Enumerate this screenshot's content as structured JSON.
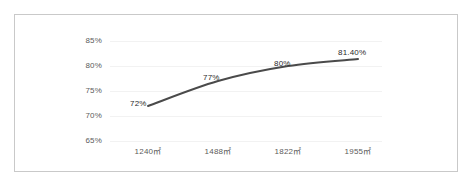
{
  "chart_data": {
    "type": "line",
    "title": "",
    "subtitle": "",
    "xlabel": "",
    "ylabel": "",
    "categories": [
      "1240㎡",
      "1488㎡",
      "1822㎡",
      "1955㎡"
    ],
    "values": [
      72,
      77,
      80,
      81.4
    ],
    "point_labels": [
      "72%",
      "77%",
      "80%",
      "81.40%"
    ],
    "yticks": [
      "85%",
      "80%",
      "75%",
      "70%",
      "65%"
    ],
    "ytick_values": [
      85,
      80,
      75,
      70,
      65
    ],
    "ylim": [
      65,
      85
    ],
    "grid": true,
    "legend": "none",
    "series": [
      {
        "name": "",
        "values": [
          72,
          77,
          80,
          81.4
        ],
        "color": "#4a4a4a",
        "smooth": true,
        "markers": false
      }
    ],
    "line_color": "#4a4a4a",
    "gridline_color": "#f2f2f2",
    "frame_color": "#c9c9c9",
    "background_color": "#ffffff",
    "tick_text_color": "#5b5b5b",
    "label_text_color": "#2b2b2b"
  }
}
